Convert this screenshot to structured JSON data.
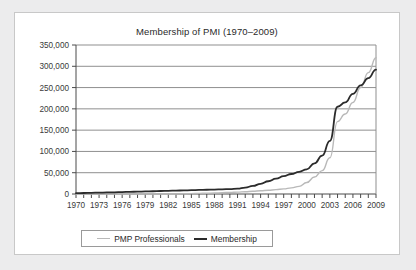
{
  "chart_data": {
    "type": "line",
    "title": "Membership of PMI (1970–2009)",
    "xlabel": "",
    "ylabel": "",
    "xlim": [
      1970,
      2009
    ],
    "ylim": [
      0,
      350000
    ],
    "grid": true,
    "legend_position": "bottom",
    "x": [
      1970,
      1971,
      1972,
      1973,
      1974,
      1975,
      1976,
      1977,
      1978,
      1979,
      1980,
      1981,
      1982,
      1983,
      1984,
      1985,
      1986,
      1987,
      1988,
      1989,
      1990,
      1991,
      1992,
      1993,
      1994,
      1995,
      1996,
      1997,
      1998,
      1999,
      2000,
      2001,
      2002,
      2003,
      2004,
      2005,
      2006,
      2007,
      2008,
      2009
    ],
    "x_tick_labels": [
      "1970",
      "1973",
      "1976",
      "1979",
      "1982",
      "1985",
      "1988",
      "1991",
      "1994",
      "1997",
      "2000",
      "2003",
      "2006",
      "2009"
    ],
    "y_tick_labels": [
      "0",
      "50,000",
      "100,000",
      "150,000",
      "200,000",
      "250,000",
      "300,000",
      "350,000"
    ],
    "y_ticks": [
      0,
      50000,
      100000,
      150000,
      200000,
      250000,
      300000,
      350000
    ],
    "series": [
      {
        "name": "PMP Professionals",
        "color": "#b9b9b9",
        "values": [
          0,
          0,
          0,
          0,
          0,
          0,
          0,
          0,
          0,
          0,
          0,
          0,
          0,
          0,
          500,
          900,
          1400,
          1900,
          2400,
          3000,
          3700,
          4500,
          5400,
          6400,
          7500,
          8800,
          10200,
          12000,
          14500,
          18000,
          27000,
          40000,
          55000,
          85000,
          170000,
          188000,
          215000,
          250000,
          285000,
          320000
        ]
      },
      {
        "name": "Membership",
        "color": "#2b2b2b",
        "values": [
          2000,
          2400,
          2800,
          3200,
          3600,
          4000,
          4500,
          5000,
          5500,
          6000,
          6500,
          7000,
          7500,
          8000,
          8500,
          9000,
          9500,
          10000,
          10500,
          11000,
          11500,
          12500,
          15000,
          19000,
          24000,
          30000,
          36000,
          42000,
          47000,
          52000,
          58000,
          72000,
          90000,
          125000,
          205000,
          215000,
          235000,
          255000,
          272000,
          292000
        ]
      }
    ]
  },
  "legend": {
    "entries": [
      {
        "label": "PMP Professionals"
      },
      {
        "label": "Membership"
      }
    ]
  },
  "colors": {
    "background": "#ececed",
    "card": "#ffffff",
    "grid": "#8f8f8f",
    "axis": "#4a4a4a",
    "pmp_line": "#b9b9b9",
    "membership_line": "#2b2b2b"
  }
}
